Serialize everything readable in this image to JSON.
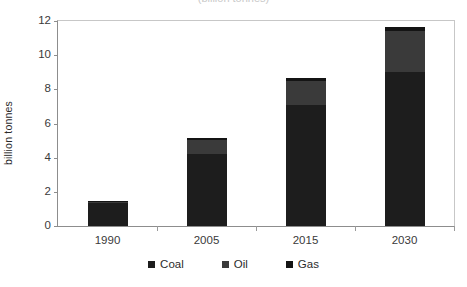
{
  "title_remnant": "(billion tonnes)",
  "chart_data": {
    "type": "bar",
    "subtype": "stacked",
    "title": "",
    "xlabel": "",
    "ylabel": "billion tonnes",
    "categories": [
      "1990",
      "2005",
      "2015",
      "2030"
    ],
    "series": [
      {
        "name": "Coal",
        "color": "#1d1d1d",
        "values": [
          1.35,
          4.2,
          7.1,
          9.0
        ]
      },
      {
        "name": "Oil",
        "color": "#3a3a3a",
        "values": [
          0.05,
          0.85,
          1.4,
          2.4
        ]
      },
      {
        "name": "Gas",
        "color": "#141414",
        "values": [
          0.05,
          0.1,
          0.15,
          0.25
        ]
      }
    ],
    "totals": [
      1.45,
      5.15,
      8.65,
      11.65
    ],
    "ylim": [
      0,
      12
    ],
    "yticks": [
      0,
      2,
      4,
      6,
      8,
      10,
      12
    ],
    "ytick_labels": [
      "0",
      "2",
      "4",
      "6",
      "8",
      "10",
      "12"
    ],
    "grid": false,
    "legend_position": "bottom"
  }
}
